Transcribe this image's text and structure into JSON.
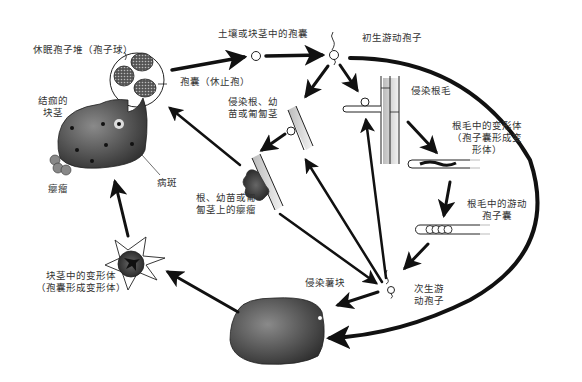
{
  "diagram": {
    "colors": {
      "ink": "#111111",
      "text": "#333333",
      "tuber_dark": "#3a3a3a",
      "tuber_mid": "#777777",
      "root_fill": "#d8d8d8"
    },
    "labels": {
      "resting_spore_ball": "休眠孢子堆（孢子球）",
      "cyst_resting": "孢囊（休止孢）",
      "cyst_in_soil": "土壤或块茎中的孢囊",
      "primary_zoospore": "初生游动孢子",
      "infect_root_hair": "侵染根毛",
      "plasmodium_in_root_hair": "根毛中的变形体\n（孢子囊形成变\n形体）",
      "zoosporangium_in_root_hair": "根毛中的游动\n孢子囊",
      "secondary_zoospore": "次生游\n动孢子",
      "infect_tuber": "侵染薯块",
      "plasmodium_in_tuber": "块茎中的变形体\n（孢囊形成变形体）",
      "infect_root_seedling_stolon": "侵染根、幼\n苗或匍匐茎",
      "gall_on_root": "根、幼苗或匍\n匐茎上的瘿瘤",
      "scabbed_tuber": "结痂的\n块茎",
      "gall": "瘿瘤",
      "lesion": "病斑"
    }
  }
}
